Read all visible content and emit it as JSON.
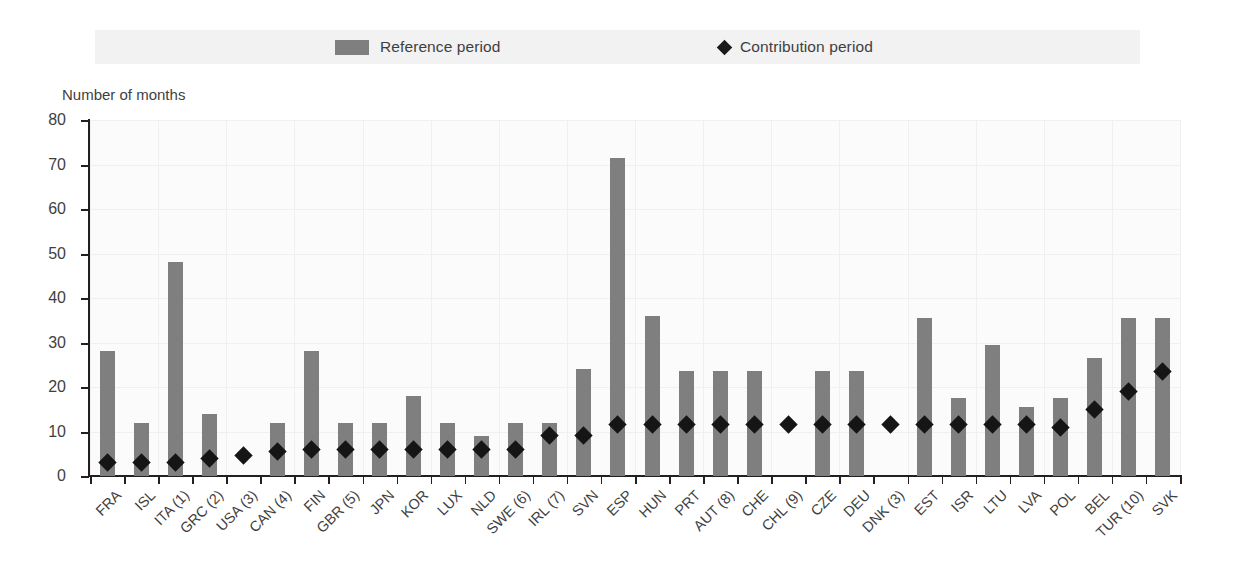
{
  "legend": {
    "reference_label": "Reference period",
    "contribution_label": "Contribution period",
    "bar_color": "#7f7f7f",
    "diamond_color": "#151515"
  },
  "axis_title": "Number of months",
  "chart_data": {
    "type": "bar",
    "title": "",
    "xlabel": "",
    "ylabel": "Number of months",
    "ylim": [
      0,
      80
    ],
    "yticks": [
      0,
      10,
      20,
      30,
      40,
      50,
      60,
      70,
      80
    ],
    "grid": true,
    "legend_position": "top",
    "categories": [
      "FRA",
      "ISL",
      "ITA (1)",
      "GRC (2)",
      "USA (3)",
      "CAN (4)",
      "FIN",
      "GBR (5)",
      "JPN",
      "KOR",
      "LUX",
      "NLD",
      "SWE (6)",
      "IRL (7)",
      "SVN",
      "ESP",
      "HUN",
      "PRT",
      "AUT (8)",
      "CHE",
      "CHL (9)",
      "CZE",
      "DEU",
      "DNK (3)",
      "EST",
      "ISR",
      "LTU",
      "LVA",
      "POL",
      "BEL",
      "TUR (10)",
      "SVK"
    ],
    "series": [
      {
        "name": "Reference period",
        "type": "bar",
        "color": "#7f7f7f",
        "values": [
          28,
          12,
          48,
          14,
          null,
          12,
          28,
          12,
          12,
          18,
          12,
          9,
          12,
          12,
          24,
          71.5,
          36,
          23.5,
          23.5,
          23.5,
          null,
          23.5,
          23.5,
          null,
          35.5,
          17.5,
          29.5,
          15.5,
          17.5,
          26.5,
          35.5,
          35.5
        ]
      },
      {
        "name": "Contribution period",
        "type": "scatter",
        "color": "#151515",
        "marker": "diamond",
        "values": [
          3,
          3,
          3,
          4,
          4.5,
          5.5,
          6,
          6,
          6,
          6,
          6,
          6,
          6,
          9,
          9,
          11.5,
          11.5,
          11.5,
          11.5,
          11.5,
          11.5,
          11.5,
          11.5,
          11.5,
          11.5,
          11.5,
          11.5,
          11.5,
          11,
          15,
          19,
          23.5
        ]
      }
    ]
  }
}
